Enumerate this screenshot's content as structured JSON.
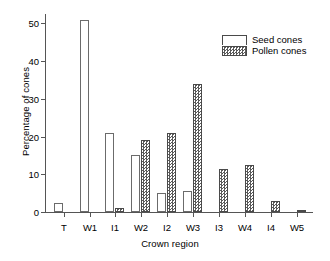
{
  "chart_data": {
    "type": "bar",
    "title": "",
    "xlabel": "Crown region",
    "ylabel": "Percentage of cones",
    "categories": [
      "T",
      "W1",
      "I1",
      "W2",
      "I2",
      "W3",
      "I3",
      "W4",
      "I4",
      "W5"
    ],
    "series": [
      {
        "name": "Seed cones",
        "values": [
          2.5,
          51,
          21,
          15,
          5,
          5.5,
          0,
          0,
          0,
          0
        ]
      },
      {
        "name": "Pollen cones",
        "values": [
          0,
          0,
          1,
          19,
          21,
          34,
          11.5,
          12.5,
          3,
          0.5
        ]
      }
    ],
    "ylim": [
      0,
      52.5
    ],
    "yticks": [
      0,
      10,
      20,
      30,
      40,
      50
    ],
    "ytick_labels": [
      "0",
      "10",
      "20",
      "30",
      "40",
      "50"
    ],
    "grid": false,
    "legend_position": "top-right",
    "legend": [
      {
        "label": "Seed cones",
        "swatch": "open-white-bar"
      },
      {
        "label": "Pollen cones",
        "swatch": "stippled-gray-bar"
      }
    ],
    "colors": {
      "seed_fill": "#ffffff",
      "seed_edge": "#6b6b6b",
      "pollen_fill": "#5a5a5a",
      "pollen_edge": "#4a4a4a",
      "axis": "#555555",
      "text": "#000000",
      "background": "#ffffff"
    }
  }
}
